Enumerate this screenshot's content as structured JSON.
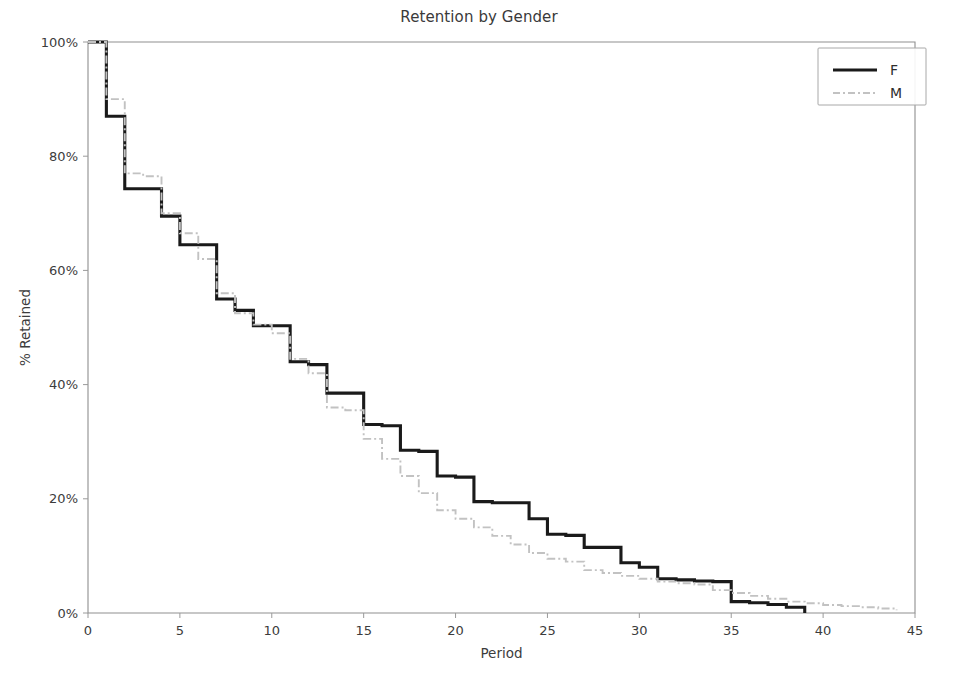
{
  "figure": {
    "width": 958,
    "height": 677,
    "background": "#ffffff"
  },
  "title": "Retention by Gender",
  "axes": {
    "xlabel": "Period",
    "ylabel": "% Retained",
    "x_ticks": [
      "0",
      "5",
      "10",
      "15",
      "20",
      "25",
      "30",
      "35",
      "40",
      "45"
    ],
    "y_ticks": [
      "0%",
      "20%",
      "40%",
      "60%",
      "80%",
      "100%"
    ]
  },
  "legend": {
    "entries": [
      {
        "label": "F",
        "color": "#1a1a1a",
        "dash": "none"
      },
      {
        "label": "M",
        "color": "#c2c2c2",
        "dash": "dashdot"
      }
    ]
  },
  "chart_data": {
    "type": "line",
    "title": "Retention by Gender",
    "xlabel": "Period",
    "ylabel": "% Retained",
    "xlim": [
      0,
      45
    ],
    "ylim": [
      0,
      100
    ],
    "xticks": [
      0,
      5,
      10,
      15,
      20,
      25,
      30,
      35,
      40,
      45
    ],
    "yticks": [
      0,
      20,
      40,
      60,
      80,
      100
    ],
    "ytick_labels": [
      "0%",
      "20%",
      "40%",
      "60%",
      "80%",
      "100%"
    ],
    "grid": false,
    "legend_position": "upper right",
    "step_style": "post",
    "series": [
      {
        "name": "F",
        "color": "#1a1a1a",
        "linestyle": "solid",
        "linewidth": 3.1,
        "x": [
          0,
          1,
          2,
          3,
          4,
          5,
          6,
          7,
          8,
          9,
          10,
          11,
          12,
          13,
          14,
          15,
          16,
          17,
          18,
          19,
          20,
          21,
          22,
          23,
          24,
          25,
          26,
          27,
          28,
          29,
          30,
          31,
          32,
          33,
          34,
          35,
          36,
          37,
          38,
          39
        ],
        "values": [
          100.0,
          87.0,
          74.3,
          74.3,
          69.5,
          64.5,
          64.5,
          55.0,
          53.0,
          50.3,
          50.3,
          44.0,
          43.5,
          38.5,
          38.5,
          33.0,
          32.8,
          28.5,
          28.3,
          24.0,
          23.8,
          19.5,
          19.3,
          19.3,
          16.5,
          13.8,
          13.6,
          11.5,
          11.5,
          8.8,
          8.0,
          6.0,
          5.8,
          5.6,
          5.5,
          2.0,
          1.8,
          1.5,
          1.0,
          0.0
        ]
      },
      {
        "name": "M",
        "color": "#c2c2c2",
        "linestyle": "dashdot",
        "linewidth": 1.9,
        "x": [
          0,
          1,
          2,
          3,
          4,
          5,
          6,
          7,
          8,
          9,
          10,
          11,
          12,
          13,
          14,
          15,
          16,
          17,
          18,
          19,
          20,
          21,
          22,
          23,
          24,
          25,
          26,
          27,
          28,
          29,
          30,
          31,
          32,
          33,
          34,
          35,
          36,
          37,
          38,
          39,
          40,
          41,
          42,
          43,
          44
        ],
        "values": [
          100.0,
          90.0,
          77.0,
          76.5,
          70.0,
          66.5,
          62.0,
          56.0,
          52.5,
          50.5,
          49.0,
          44.5,
          42.0,
          36.0,
          35.5,
          30.5,
          27.0,
          24.0,
          21.0,
          18.0,
          16.5,
          15.0,
          13.5,
          12.0,
          10.5,
          9.5,
          9.0,
          7.5,
          7.0,
          6.5,
          6.0,
          5.5,
          5.2,
          5.0,
          4.0,
          3.5,
          3.0,
          2.5,
          2.0,
          1.7,
          1.4,
          1.2,
          1.0,
          0.8,
          0.5
        ]
      }
    ]
  }
}
